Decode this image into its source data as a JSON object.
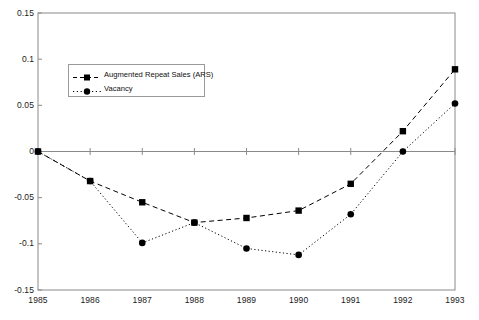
{
  "chart_data": {
    "type": "line",
    "title": "",
    "xlabel": "",
    "ylabel": "",
    "categories": [
      "1985",
      "1986",
      "1987",
      "1988",
      "1989",
      "1990",
      "1991",
      "1992",
      "1993"
    ],
    "x": [
      1985,
      1986,
      1987,
      1988,
      1989,
      1990,
      1991,
      1992,
      1993
    ],
    "xlim": [
      1985,
      1993
    ],
    "ylim": [
      -0.15,
      0.15
    ],
    "yticks": [
      0.15,
      0.1,
      0.05,
      0,
      -0.05,
      -0.1,
      -0.15
    ],
    "ytick_labels": [
      "0.15",
      "0.1",
      "0.05",
      "0",
      "-0.05",
      "-0.1",
      "-0.15"
    ],
    "xtick_labels": [
      "1985",
      "1986",
      "1987",
      "1988",
      "1989",
      "1990",
      "1991",
      "1992",
      "1993"
    ],
    "grid": false,
    "legend_position": "upper-left-inside",
    "series": [
      {
        "name": "Augmented Repeat Sales (ARS)",
        "marker": "square",
        "linestyle": "dashed",
        "color": "#000000",
        "values": [
          0,
          -0.032,
          -0.055,
          -0.077,
          -0.072,
          -0.064,
          -0.035,
          0.022,
          0.089
        ]
      },
      {
        "name": "Vacancy",
        "marker": "circle",
        "linestyle": "dotted",
        "color": "#000000",
        "values": [
          0,
          -0.032,
          -0.099,
          -0.077,
          -0.105,
          -0.112,
          -0.068,
          0.0,
          0.052
        ]
      }
    ]
  },
  "legend": {
    "items": [
      {
        "label": "Augmented Repeat Sales (ARS)"
      },
      {
        "label": "Vacancy"
      }
    ]
  },
  "axes": {
    "frame_color": "#8a8a8a",
    "zero_line_color": "#8a8a8a"
  }
}
